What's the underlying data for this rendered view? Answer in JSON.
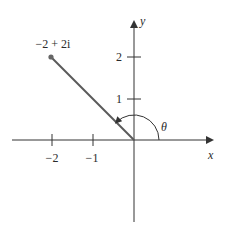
{
  "diagram": {
    "type": "complex-plane",
    "point": {
      "label": "−2 + 2i",
      "re": -2,
      "im": 2
    },
    "angle_label": "θ",
    "axes": {
      "x": {
        "label": "x",
        "ticks": [
          {
            "value": -2,
            "label": "−2"
          },
          {
            "value": -1,
            "label": "−1"
          }
        ]
      },
      "y": {
        "label": "y",
        "ticks": [
          {
            "value": 1,
            "label": "1"
          },
          {
            "value": 2,
            "label": "2"
          }
        ]
      }
    }
  },
  "colors": {
    "axis": "#333333",
    "vector": "#5a5a5a",
    "text": "#2a2a2a",
    "background": "#ffffff"
  }
}
